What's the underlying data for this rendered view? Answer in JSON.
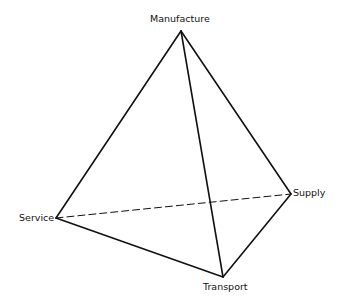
{
  "diagram": {
    "type": "tetrahedron",
    "vertices": {
      "manufacture": {
        "label": "Manufacture",
        "x": 181,
        "y": 31
      },
      "service": {
        "label": "Service",
        "x": 56,
        "y": 218
      },
      "supply": {
        "label": "Supply",
        "x": 291,
        "y": 194
      },
      "transport": {
        "label": "Transport",
        "x": 223,
        "y": 277
      }
    },
    "edges": [
      {
        "from": "manufacture",
        "to": "service",
        "style": "solid"
      },
      {
        "from": "manufacture",
        "to": "supply",
        "style": "solid"
      },
      {
        "from": "manufacture",
        "to": "transport",
        "style": "solid"
      },
      {
        "from": "service",
        "to": "transport",
        "style": "solid"
      },
      {
        "from": "supply",
        "to": "transport",
        "style": "solid"
      },
      {
        "from": "service",
        "to": "supply",
        "style": "dashed"
      }
    ],
    "line_color": "#111111"
  }
}
